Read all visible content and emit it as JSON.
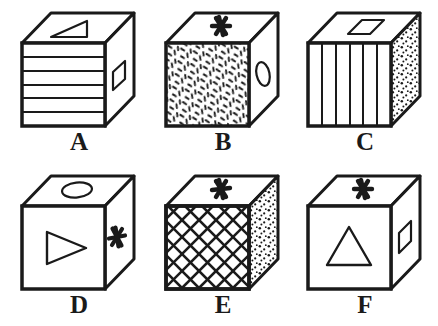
{
  "figure": {
    "background_color": "#ffffff",
    "stroke_color": "#1a1a1a",
    "fill_color": "#ffffff",
    "rows": 2,
    "columns": 3
  },
  "cubes": [
    {
      "label": "A",
      "top_face": {
        "pattern": "none",
        "symbol": "right-triangle"
      },
      "front_face": {
        "pattern": "horizontal-stripes",
        "stripe_count": 6,
        "symbol": "none"
      },
      "right_face": {
        "pattern": "none",
        "symbol": "parallelogram"
      }
    },
    {
      "label": "B",
      "top_face": {
        "pattern": "none",
        "symbol": "asterisk"
      },
      "front_face": {
        "pattern": "random-dashes",
        "symbol": "none"
      },
      "right_face": {
        "pattern": "none",
        "symbol": "oval"
      }
    },
    {
      "label": "C",
      "top_face": {
        "pattern": "none",
        "symbol": "parallelogram"
      },
      "front_face": {
        "pattern": "vertical-stripes",
        "stripe_count": 6,
        "symbol": "none"
      },
      "right_face": {
        "pattern": "stipple-dots",
        "symbol": "none"
      }
    },
    {
      "label": "D",
      "top_face": {
        "pattern": "none",
        "symbol": "oval"
      },
      "front_face": {
        "pattern": "none",
        "symbol": "right-pointing-triangle"
      },
      "right_face": {
        "pattern": "none",
        "symbol": "asterisk"
      }
    },
    {
      "label": "E",
      "top_face": {
        "pattern": "none",
        "symbol": "asterisk"
      },
      "front_face": {
        "pattern": "diagonal-crosshatch",
        "symbol": "none"
      },
      "right_face": {
        "pattern": "stipple-dots",
        "symbol": "none"
      }
    },
    {
      "label": "F",
      "top_face": {
        "pattern": "none",
        "symbol": "asterisk"
      },
      "front_face": {
        "pattern": "none",
        "symbol": "triangle"
      },
      "right_face": {
        "pattern": "none",
        "symbol": "parallelogram"
      }
    }
  ]
}
